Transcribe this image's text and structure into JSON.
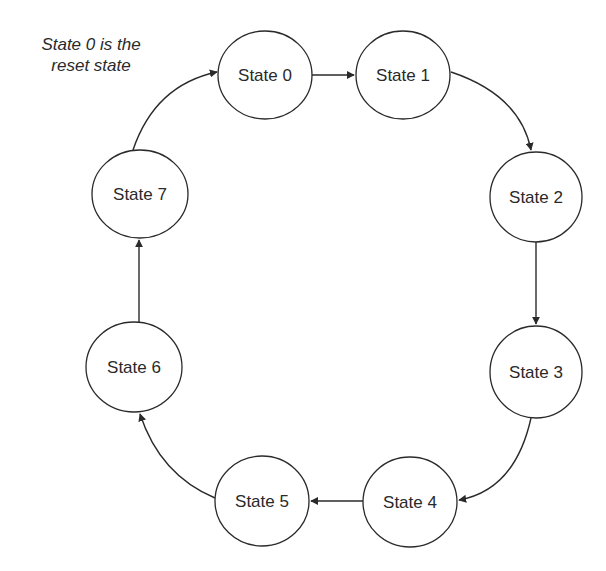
{
  "note": {
    "line1": "State 0 is the",
    "line2": "reset state"
  },
  "states": [
    {
      "id": "s0",
      "label": "State 0"
    },
    {
      "id": "s1",
      "label": "State 1"
    },
    {
      "id": "s2",
      "label": "State 2"
    },
    {
      "id": "s3",
      "label": "State 3"
    },
    {
      "id": "s4",
      "label": "State 4"
    },
    {
      "id": "s5",
      "label": "State 5"
    },
    {
      "id": "s6",
      "label": "State 6"
    },
    {
      "id": "s7",
      "label": "State 7"
    }
  ],
  "transitions": [
    {
      "from": "State 0",
      "to": "State 1"
    },
    {
      "from": "State 1",
      "to": "State 2"
    },
    {
      "from": "State 2",
      "to": "State 3"
    },
    {
      "from": "State 3",
      "to": "State 4"
    },
    {
      "from": "State 4",
      "to": "State 5"
    },
    {
      "from": "State 5",
      "to": "State 6"
    },
    {
      "from": "State 6",
      "to": "State 7"
    },
    {
      "from": "State 7",
      "to": "State 0"
    }
  ],
  "colors": {
    "stroke": "#2a2a2a",
    "background": "#ffffff"
  }
}
